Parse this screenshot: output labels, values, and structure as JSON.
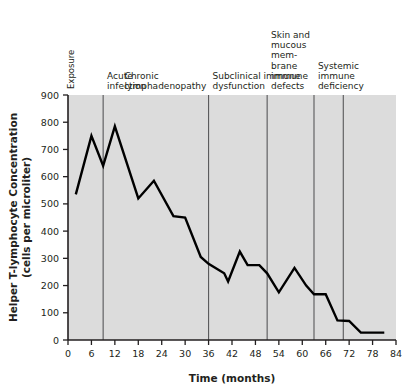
{
  "chart_data": {
    "type": "line",
    "title": "",
    "xlabel": "Time (months)",
    "ylabel": "Helper T-lymphocyte Concentration (cells per microliter)",
    "ylabel_line1": "Helper T-lymphocyte Concentration",
    "ylabel_line2": "(cells per microliter)",
    "xlim": [
      0,
      84
    ],
    "ylim": [
      0,
      900
    ],
    "xticks": [
      0,
      6,
      12,
      18,
      24,
      30,
      36,
      42,
      48,
      54,
      60,
      66,
      72,
      78,
      84
    ],
    "yticks": [
      0,
      100,
      200,
      300,
      400,
      500,
      600,
      700,
      800,
      900
    ],
    "grid": false,
    "legend": "none",
    "series": [
      {
        "name": "Helper T-lymphocyte concentration",
        "color": "#000000",
        "x": [
          2,
          6,
          9,
          12,
          18,
          22,
          27,
          30,
          34,
          36,
          40,
          41,
          44,
          46,
          49,
          51,
          54,
          58,
          61,
          63,
          66,
          69,
          72,
          75,
          81
        ],
        "values": [
          535,
          750,
          640,
          785,
          520,
          585,
          455,
          450,
          305,
          280,
          245,
          215,
          325,
          275,
          275,
          245,
          175,
          265,
          200,
          168,
          168,
          72,
          70,
          27,
          27
        ]
      }
    ],
    "phase_dividers": [
      {
        "x": 9,
        "name": "divider-acute-chronic"
      },
      {
        "x": 36,
        "name": "divider-chronic-subclinical"
      },
      {
        "x": 51,
        "name": "divider-subclinical-skin"
      },
      {
        "x": 63,
        "name": "divider-skin-systemic"
      },
      {
        "x": 70.5,
        "name": "divider-systemic"
      }
    ],
    "annotations": [
      {
        "id": "exposure",
        "text": "Exposure",
        "orientation": "vertical",
        "x": 1.5
      },
      {
        "id": "acute-infection",
        "lines": [
          "Acute",
          "infection"
        ],
        "x": 10
      },
      {
        "id": "chronic-lymphadenopathy",
        "lines": [
          "Chronic",
          "lymphadenopathy"
        ],
        "x": 14.5
      },
      {
        "id": "subclinical-immune-dysfunction",
        "lines": [
          "Subclinical immune",
          "dysfunction"
        ],
        "x": 37
      },
      {
        "id": "skin-mucous-membrane",
        "lines": [
          "Skin and",
          "mucous",
          "mem-",
          "brane",
          "immune",
          "defects"
        ],
        "x": 52
      },
      {
        "id": "systemic-immune-deficiency",
        "lines": [
          "Systemic",
          "immune",
          "deficiency"
        ],
        "x": 64
      }
    ],
    "colors": {
      "plot_background": "#dcdcdc",
      "line": "#000000",
      "axis": "#231f20",
      "divider": "#58585a",
      "text": "#231f20",
      "page_background": "#ffffff"
    }
  }
}
